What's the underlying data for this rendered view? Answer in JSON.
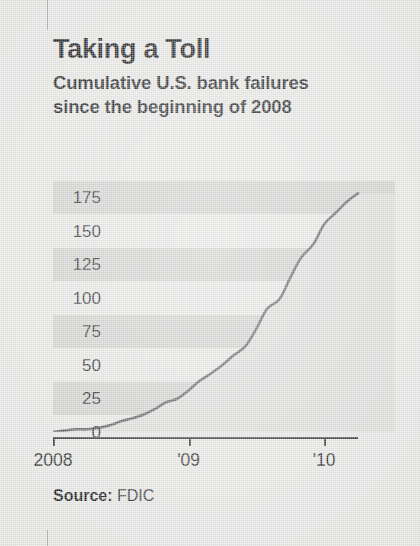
{
  "header": {
    "title": "Taking a Toll",
    "subtitle_lines": [
      "Cumulative U.S. bank failures",
      "since the beginning of 2008"
    ]
  },
  "source": {
    "label": "Source:",
    "value": "FDIC"
  },
  "colors": {
    "paper": "#e6e6e4",
    "band": "#cfcfcd",
    "line": "#5a5b5d",
    "area_fill": "#dcdcda",
    "text": "#1d1e20",
    "axis": "#2d2e30"
  },
  "chart_data": {
    "type": "area",
    "title": "Taking a Toll",
    "subtitle": "Cumulative U.S. bank failures since the beginning of 2008",
    "xlabel": "",
    "ylabel": "",
    "grid": false,
    "banded_rows": true,
    "legend_position": "none",
    "source": "FDIC",
    "ylim": [
      0,
      185
    ],
    "yticks": [
      0,
      25,
      50,
      75,
      100,
      125,
      150,
      175
    ],
    "ytick_labels": [
      "0",
      "25",
      "50",
      "75",
      "100",
      "125",
      "150",
      "175"
    ],
    "xlim": [
      2008.0,
      2010.25
    ],
    "xticks": [
      2008,
      2009,
      2010
    ],
    "xtick_labels": [
      "2008",
      "'09",
      "'10"
    ],
    "series": [
      {
        "name": "Cumulative U.S. bank failures since 2008",
        "x": [
          2008.0,
          2008.08,
          2008.17,
          2008.25,
          2008.33,
          2008.42,
          2008.5,
          2008.58,
          2008.67,
          2008.75,
          2008.83,
          2008.92,
          2009.0,
          2009.08,
          2009.17,
          2009.25,
          2009.33,
          2009.42,
          2009.5,
          2009.58,
          2009.67,
          2009.75,
          2009.83,
          2009.92,
          2010.0,
          2010.08,
          2010.17,
          2010.25
        ],
        "values": [
          0,
          1,
          2,
          2,
          3,
          5,
          8,
          10,
          13,
          17,
          22,
          25,
          31,
          38,
          44,
          50,
          57,
          64,
          77,
          92,
          99,
          115,
          130,
          140,
          155,
          163,
          172,
          178
        ]
      }
    ],
    "final_value": 178,
    "annotations": []
  }
}
